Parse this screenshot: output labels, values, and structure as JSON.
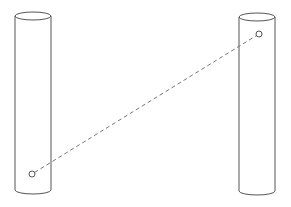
{
  "diagram": {
    "background": "#ffffff",
    "stroke_color": "#555555",
    "dash_color": "#777777",
    "cylinders": [
      {
        "id": "left-cylinder",
        "left": 15,
        "right": 51,
        "top_cy": 16,
        "bottom_cy": 190,
        "ry": 4
      },
      {
        "id": "right-cylinder",
        "left": 239,
        "right": 275,
        "top_cy": 17,
        "bottom_cy": 191,
        "ry": 4
      }
    ],
    "points": [
      {
        "id": "left-point",
        "x": 32,
        "y": 174,
        "r": 3
      },
      {
        "id": "right-point",
        "x": 259,
        "y": 34,
        "r": 3
      }
    ],
    "connector": {
      "style": "dashed",
      "from": "left-point",
      "to": "right-point"
    }
  }
}
